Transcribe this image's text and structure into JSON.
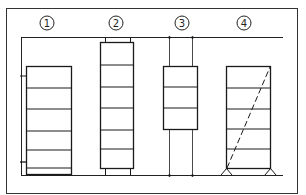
{
  "diagram": {
    "stroke_color": "#1a1a1a",
    "labels": [
      {
        "id": "1",
        "text": "1",
        "cx": 47,
        "cy": 23
      },
      {
        "id": "2",
        "text": "2",
        "cx": 116,
        "cy": 23
      },
      {
        "id": "3",
        "text": "3",
        "cx": 182,
        "cy": 23
      },
      {
        "id": "4",
        "text": "4",
        "cx": 244,
        "cy": 23
      }
    ]
  }
}
